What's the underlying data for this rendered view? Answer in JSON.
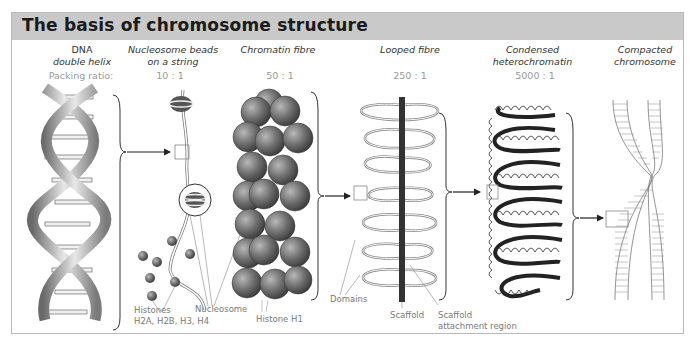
{
  "figure": {
    "title": "The basis of chromosome structure",
    "packing_label": "Packing ratio:",
    "stages": [
      {
        "name_line1": "DNA",
        "name_line2": "double helix",
        "ratio": ""
      },
      {
        "name_line1": "Nucleosome beads",
        "name_line2": "on a string",
        "ratio": "10 : 1"
      },
      {
        "name_line1": "Chromatin fibre",
        "name_line2": "",
        "ratio": "50 : 1"
      },
      {
        "name_line1": "Looped fibre",
        "name_line2": "",
        "ratio": "250 : 1"
      },
      {
        "name_line1": "Condensed",
        "name_line2": "heterochromatin",
        "ratio": "5000 : 1"
      },
      {
        "name_line1": "Compacted",
        "name_line2": "chromosome",
        "ratio": ""
      }
    ],
    "annotations": {
      "histones_line1": "Histones",
      "histones_line2": "H2A, H2B, H3, H4",
      "nucleosome": "Nucleosome",
      "histone_h1": "Histone H1",
      "domains": "Domains",
      "scaffold": "Scaffold",
      "scaffold_attach_line1": "Scaffold",
      "scaffold_attach_line2": "attachment region"
    },
    "colors": {
      "header_bg": "#c9c9c9",
      "frame_border": "#b8b8b8",
      "sphere_dark": "#555555",
      "scaffold": "#333333"
    }
  }
}
